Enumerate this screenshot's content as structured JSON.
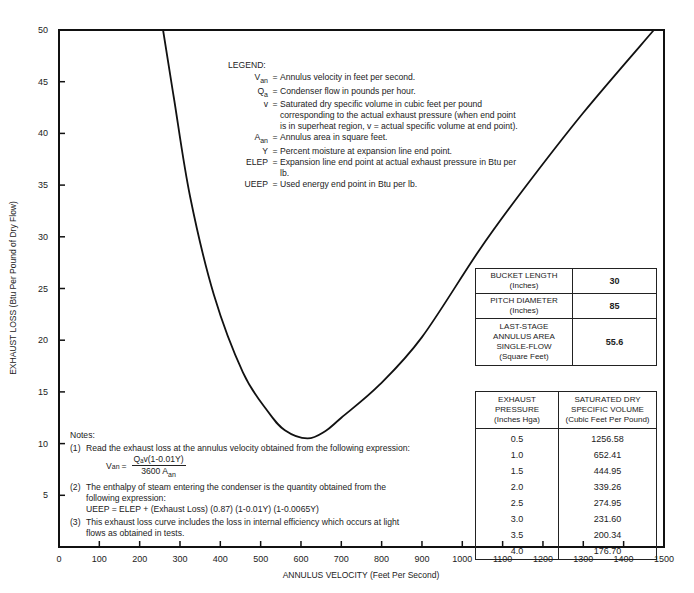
{
  "chart_data": {
    "type": "line",
    "title": "",
    "xlabel": "ANNULUS VELOCITY (Feet Per Second)",
    "ylabel": "EXHAUST LOSS (Btu Per Pound of Dry Flow)",
    "xlim": [
      0,
      1500
    ],
    "ylim": [
      0,
      50
    ],
    "xticks": [
      0,
      100,
      200,
      300,
      400,
      500,
      600,
      700,
      800,
      900,
      1000,
      1100,
      1200,
      1300,
      1400,
      1500
    ],
    "yticks": [
      5,
      10,
      15,
      20,
      25,
      30,
      35,
      40,
      45,
      50
    ],
    "grid": false,
    "series": [
      {
        "name": "Exhaust loss curve",
        "x": [
          258,
          285,
          325,
          384,
          456,
          518,
          560,
          616,
          660,
          700,
          795,
          900,
          1042,
          1150,
          1300,
          1475
        ],
        "y": [
          50,
          43.4,
          33.9,
          24.4,
          16.9,
          13.1,
          11.3,
          10.5,
          11.2,
          12.5,
          15.7,
          20.3,
          28.7,
          34.5,
          42,
          50
        ]
      }
    ]
  },
  "axis": {
    "xlabel": "ANNULUS VELOCITY (Feet Per Second)",
    "ylabel": "EXHAUST LOSS (Btu Per Pound of Dry Flow)",
    "xticks": [
      "0",
      "100",
      "200",
      "300",
      "400",
      "500",
      "600",
      "700",
      "800",
      "900",
      "1000",
      "1100",
      "1200",
      "1300",
      "1400",
      "1500"
    ],
    "yticks": [
      "5",
      "10",
      "15",
      "20",
      "25",
      "30",
      "35",
      "40",
      "45",
      "50"
    ]
  },
  "legend": {
    "title": "LEGEND:",
    "items": [
      {
        "sym": "V",
        "sub": "an",
        "def": "Annulus velocity in feet per second."
      },
      {
        "sym": "Q",
        "sub": "a",
        "def": "Condenser flow in pounds per hour."
      },
      {
        "sym": "v",
        "sub": "",
        "def": "Saturated dry specific volume in cubic feet per pound corresponding to the actual exhaust pressure (when end point is in superheat region, v = actual specific volume at end point)."
      },
      {
        "sym": "A",
        "sub": "an",
        "def": "Annulus area in square feet."
      },
      {
        "sym": "Y",
        "sub": "",
        "def": "Percent moisture at expansion line end point."
      },
      {
        "sym": "ELEP",
        "sub": "",
        "def": "Expansion line end point at actual exhaust pressure in Btu per lb."
      },
      {
        "sym": "UEEP",
        "sub": "",
        "def": "Used energy end point in Btu per lb."
      }
    ]
  },
  "notes": {
    "title": "Notes:",
    "n1_num": "(1)",
    "n1": "Read the exhaust loss at the annulus velocity obtained from the following expression:",
    "f_lhs": "V",
    "f_lhs_sub": "an",
    "f_num": "Qₐv(1-0.01Y)",
    "f_den": "3600 A",
    "f_den_sub": "an",
    "n2_num": "(2)",
    "n2": "The enthalpy of steam entering the condenser is the quantity obtained from the following expression:",
    "n2_expr": "UEEP = ELEP + (Exhaust Loss) (0.87) (1-0.01Y) (1-0.0065Y)",
    "n3_num": "(3)",
    "n3": "This exhaust loss curve includes the loss in internal efficiency which occurs at light flows as obtained in tests."
  },
  "specs": [
    {
      "label": "BUCKET LENGTH",
      "unit": "(Inches)",
      "value": "30"
    },
    {
      "label": "PITCH DIAMETER",
      "unit": "(Inches)",
      "value": "85"
    },
    {
      "label": "LAST-STAGE ANNULUS AREA SINGLE-FLOW",
      "unit": "(Square Feet)",
      "value": "55.6"
    }
  ],
  "pressure_table": {
    "headers": [
      {
        "l1": "EXHAUST",
        "l2": "PRESSURE",
        "l3": "(Inches Hga)"
      },
      {
        "l1": "SATURATED DRY",
        "l2": "SPECIFIC VOLUME",
        "l3": "(Cubic Feet Per Pound)"
      }
    ],
    "rows": [
      [
        "0.5",
        "1256.58"
      ],
      [
        "1.0",
        "652.41"
      ],
      [
        "1.5",
        "444.95"
      ],
      [
        "2.0",
        "339.26"
      ],
      [
        "2.5",
        "274.95"
      ],
      [
        "3.0",
        "231.60"
      ],
      [
        "3.5",
        "200.34"
      ],
      [
        "4.0",
        "176.70"
      ]
    ]
  }
}
